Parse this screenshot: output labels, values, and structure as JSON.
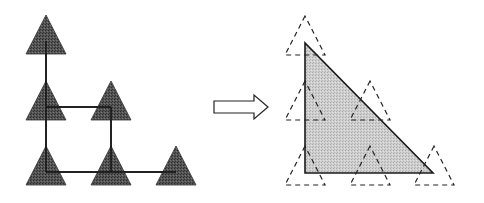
{
  "diagram": {
    "colors": {
      "dark_fill": "#4a4a4a",
      "light_fill": "#c8c8c8",
      "stroke": "#1a1a1a",
      "background": "#ffffff"
    },
    "left_panel": {
      "nodes": [
        {
          "id": "n00",
          "apex": [
            46,
            15
          ]
        },
        {
          "id": "n10",
          "apex": [
            46,
            81
          ]
        },
        {
          "id": "n11",
          "apex": [
            111,
            81
          ]
        },
        {
          "id": "n20",
          "apex": [
            46,
            146
          ]
        },
        {
          "id": "n21",
          "apex": [
            111,
            146
          ]
        },
        {
          "id": "n22",
          "apex": [
            176,
            146
          ]
        }
      ],
      "edges": [
        [
          "n00",
          "n10"
        ],
        [
          "n10",
          "n20"
        ],
        [
          "n10",
          "n11"
        ],
        [
          "n11",
          "n21"
        ],
        [
          "n20",
          "n21"
        ],
        [
          "n21",
          "n22"
        ]
      ]
    },
    "arrow": {
      "direction": "right",
      "x": [
        214,
        268
      ],
      "y": 107
    },
    "right_panel": {
      "covering_triangle": [
        [
          305,
          43
        ],
        [
          305,
          173
        ],
        [
          433,
          173
        ]
      ],
      "dashed_triangles": [
        {
          "apex": [
            305,
            16
          ]
        },
        {
          "apex": [
            305,
            81
          ]
        },
        {
          "apex": [
            370,
            81
          ]
        },
        {
          "apex": [
            305,
            146
          ]
        },
        {
          "apex": [
            370,
            146
          ]
        },
        {
          "apex": [
            434,
            146
          ]
        }
      ]
    }
  }
}
